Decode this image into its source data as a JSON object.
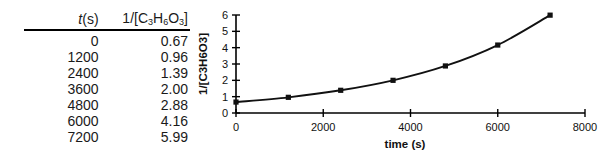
{
  "table": {
    "headers": {
      "time_prefix": "t",
      "time_suffix": "(s)",
      "conc_prefix": "1/[C",
      "conc_sub1": "3",
      "conc_mid1": "H",
      "conc_sub2": "6",
      "conc_mid2": "O",
      "conc_sub3": "3",
      "conc_suffix": "]"
    },
    "rows": [
      {
        "t": "0",
        "v": "0.67"
      },
      {
        "t": "1200",
        "v": "0.96"
      },
      {
        "t": "2400",
        "v": "1.39"
      },
      {
        "t": "3600",
        "v": "2.00"
      },
      {
        "t": "4800",
        "v": "2.88"
      },
      {
        "t": "6000",
        "v": "4.16"
      },
      {
        "t": "7200",
        "v": "5.99"
      }
    ]
  },
  "chart_data": {
    "type": "line",
    "title": "",
    "xlabel": "time (s)",
    "ylabel": "1/[C3H6O3]",
    "x": [
      0,
      1200,
      2400,
      3600,
      4800,
      6000,
      7200
    ],
    "values": [
      0.67,
      0.96,
      1.39,
      2.0,
      2.88,
      4.16,
      5.99
    ],
    "series": [
      {
        "name": "1/[C3H6O3]",
        "values": [
          0.67,
          0.96,
          1.39,
          2.0,
          2.88,
          4.16,
          5.99
        ]
      }
    ],
    "xlim": [
      0,
      8000
    ],
    "ylim": [
      0,
      6
    ],
    "xticks": [
      0,
      2000,
      4000,
      6000,
      8000
    ],
    "xtick_labels": [
      "0",
      "2000",
      "4000",
      "6000",
      "8000"
    ],
    "yticks": [
      0,
      1,
      2,
      3,
      4,
      5,
      6
    ],
    "ytick_labels": [
      "0",
      "1",
      "2",
      "3",
      "4",
      "5",
      "6"
    ],
    "grid": false,
    "legend": false,
    "marker": "square",
    "line_color": "#111111",
    "marker_color": "#111111"
  }
}
